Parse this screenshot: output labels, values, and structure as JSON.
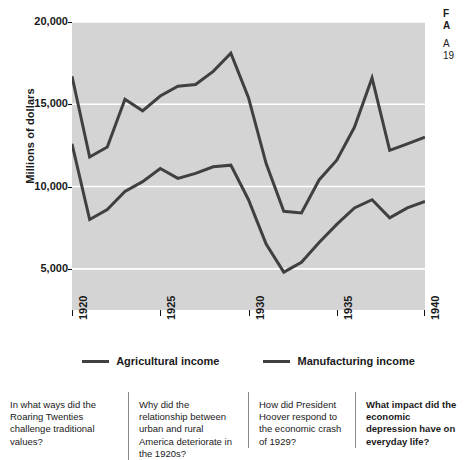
{
  "caption": {
    "title": "F\nA",
    "body": "A\n19"
  },
  "chart_data": {
    "type": "line",
    "title": "",
    "subtitle": "",
    "xlabel": "",
    "ylabel": "Millions of dollars",
    "xlim": [
      1920,
      1940
    ],
    "ylim": [
      2500,
      20000
    ],
    "grid": true,
    "legend_position": "bottom",
    "plot_background": "#d4d4d4",
    "gridline_color": "#ffffff",
    "x": [
      1920,
      1921,
      1922,
      1923,
      1924,
      1925,
      1926,
      1927,
      1928,
      1929,
      1930,
      1931,
      1932,
      1933,
      1934,
      1935,
      1936,
      1937,
      1938,
      1939,
      1940
    ],
    "xticks": [
      "1920",
      "1925",
      "1930",
      "1935",
      "1940"
    ],
    "xtick_values": [
      1920,
      1925,
      1930,
      1935,
      1940
    ],
    "yticks": [
      "20,000",
      "15,000",
      "10,000",
      "5,000"
    ],
    "ytick_values": [
      20000,
      15000,
      10000,
      5000
    ],
    "series": [
      {
        "name": "Agricultural income",
        "color": "#404040",
        "values": [
          12600,
          8000,
          8600,
          9700,
          10300,
          11100,
          10500,
          10800,
          11200,
          11300,
          9200,
          6500,
          4800,
          5400,
          6600,
          7700,
          8700,
          9200,
          8100,
          8700,
          9100
        ]
      },
      {
        "name": "Manufacturing income",
        "color": "#404040",
        "values": [
          16700,
          11800,
          12400,
          15300,
          14600,
          15500,
          16100,
          16200,
          17000,
          18100,
          15400,
          11400,
          8500,
          8400,
          10400,
          11600,
          13600,
          16600,
          12200,
          12600,
          13000
        ]
      }
    ]
  },
  "legend": {
    "entries": [
      {
        "label": "Agricultural income"
      },
      {
        "label": "Manufacturing income"
      }
    ]
  },
  "questions": [
    {
      "text": "In what ways did the Roaring Twenties challenge traditional values?",
      "highlighted": false
    },
    {
      "text": "Why did the relationship between urban and rural America deteriorate in the 1920s?",
      "highlighted": false
    },
    {
      "text": "How did President Hoover respond to the economic crash of 1929?",
      "highlighted": false
    },
    {
      "text": "What impact did the economic depression have on everyday life?",
      "highlighted": true
    }
  ]
}
